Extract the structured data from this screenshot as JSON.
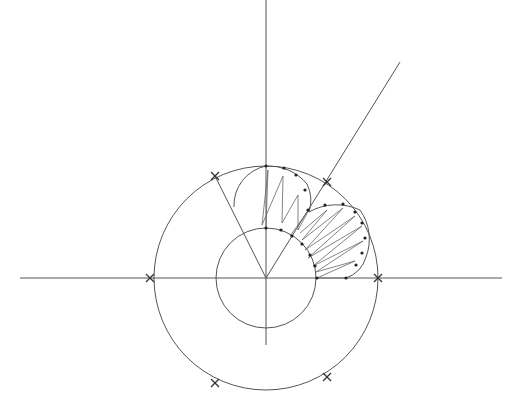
{
  "caption": "",
  "diagram": {
    "type": "geometric-construction",
    "center": [
      266,
      278
    ],
    "outer_circle_radius": 112,
    "inner_circle_radius": 50,
    "axes": {
      "horizontal": {
        "x1": 20,
        "x2": 502,
        "y": 278
      },
      "vertical": {
        "x": 266,
        "y1": 0,
        "y2": 345
      }
    },
    "diagonal_ray": {
      "x1": 266,
      "y1": 278,
      "x2": 400,
      "y2": 62
    },
    "left_ray": {
      "x1": 266,
      "y1": 278,
      "x2": 215,
      "y2": 176
    },
    "cross_marks": [
      [
        150,
        278
      ],
      [
        215,
        176
      ],
      [
        327,
        182
      ],
      [
        378,
        278
      ],
      [
        215,
        383
      ],
      [
        327,
        377
      ]
    ],
    "colors": {
      "line": "#555555",
      "background": "#ffffff"
    }
  }
}
